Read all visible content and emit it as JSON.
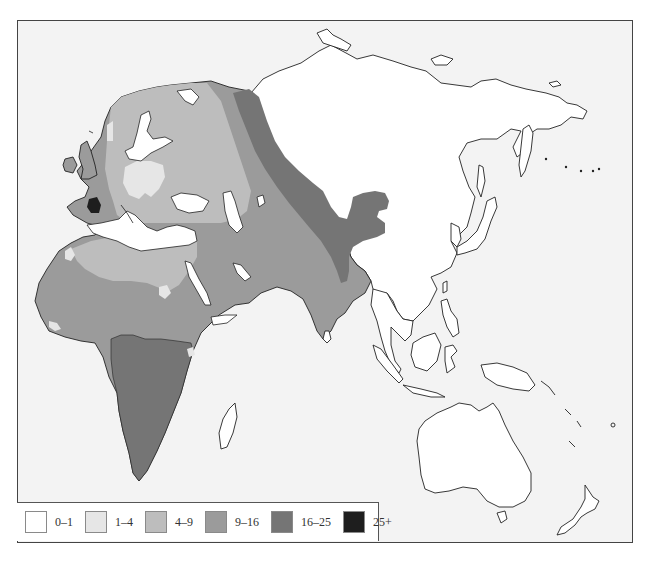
{
  "map": {
    "region_shown": "Europe, Africa, Asia and Oceania",
    "background_color": "#f3f3f3",
    "land_unshaded_color": "#ffffff",
    "coastline_color": "#222222"
  },
  "legend": {
    "items": [
      {
        "label": "0–1",
        "color": "#ffffff"
      },
      {
        "label": "1–4",
        "color": "#e6e6e6"
      },
      {
        "label": "4–9",
        "color": "#bdbdbd"
      },
      {
        "label": "9–16",
        "color": "#9b9b9b"
      },
      {
        "label": "16–25",
        "color": "#757575"
      },
      {
        "label": "25+",
        "color": "#1e1e1e"
      }
    ]
  },
  "zones": [
    {
      "area": "Siberia, China, East Asia, Southeast Asia, Australia, Oceania",
      "class": "0–1"
    },
    {
      "area": "Central Europe (Poland) patch, NW Africa spots, Scandinavian coast",
      "class": "1–4"
    },
    {
      "area": "Northern/Eastern Europe, Sahara, Caspian region",
      "class": "4–9"
    },
    {
      "area": "Western Europe, Iberia, British Isles, West Africa, Arabia, Iran, India",
      "class": "9–16"
    },
    {
      "area": "Sub-Saharan Africa, Western Siberia band, Central Asia/Tibet",
      "class": "16–25"
    },
    {
      "area": "Basque region (SW France / N Spain)",
      "class": "25+"
    }
  ]
}
